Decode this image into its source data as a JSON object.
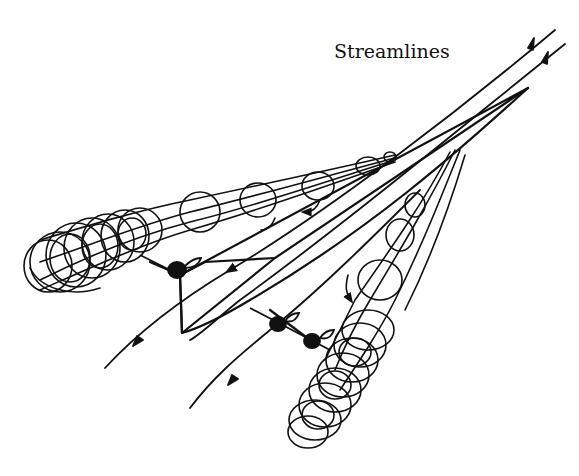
{
  "diagram": {
    "labels": {
      "streamlines": "Streamlines"
    },
    "colors": {
      "ink": "#111111",
      "background": "#ffffff"
    },
    "elements": [
      "delta-wing-planform",
      "left-leading-edge-vortex",
      "right-leading-edge-vortex",
      "free-stream-streamlines",
      "vortex-breakdown-regions",
      "vortex-core-markers"
    ]
  }
}
